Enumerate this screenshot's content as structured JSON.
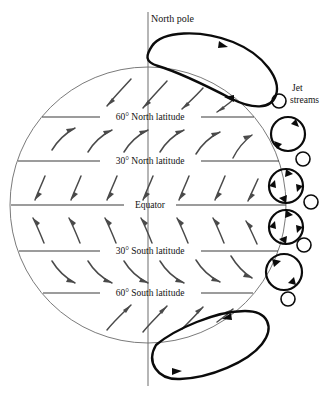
{
  "figure": {
    "type": "diagram"
  },
  "labels": {
    "north_pole": "North pole",
    "jet_streams_line1": "Jet",
    "jet_streams_line2": "streams",
    "latitudes": [
      {
        "id": "lat-60n",
        "text": "60° North latitude"
      },
      {
        "id": "lat-30n",
        "text": "30° North latitude"
      },
      {
        "id": "equator",
        "text": "Equator"
      },
      {
        "id": "lat-30s",
        "text": "30° South latitude"
      },
      {
        "id": "lat-60s",
        "text": "60° South latitude"
      }
    ]
  },
  "colors": {
    "background": "#ffffff",
    "globe_outline": "#6b6b6b",
    "latitude_line": "#3a3a3a",
    "axis_line": "#7a7a7a",
    "wind_arrow": "#4a4a4a",
    "cell_loop": "#0b0b0b",
    "jet_stream": "#0b0b0b",
    "text": "#131313"
  },
  "geometry": {
    "globe_center_x": 148,
    "globe_center_y": 205,
    "globe_radius": 138,
    "axis_top_y": 12,
    "axis_bottom_y": 386,
    "latitude_y": {
      "lat_60n": 117,
      "lat_30n": 161,
      "equator": 205,
      "lat_30s": 251,
      "lat_60s": 293
    }
  },
  "jet_stream_circles": [
    {
      "id": "jet-small-1",
      "cx": 279,
      "cy": 101,
      "r": 7,
      "size": "small"
    },
    {
      "id": "jet-large-1",
      "cx": 288,
      "cy": 134,
      "r": 17,
      "size": "large"
    },
    {
      "id": "jet-small-2",
      "cx": 303,
      "cy": 159,
      "r": 7,
      "size": "small"
    },
    {
      "id": "jet-large-2",
      "cx": 286,
      "cy": 186,
      "r": 17,
      "size": "large"
    },
    {
      "id": "jet-small-3",
      "cx": 311,
      "cy": 202,
      "r": 7,
      "size": "small"
    },
    {
      "id": "jet-large-3",
      "cx": 286,
      "cy": 227,
      "r": 17,
      "size": "large"
    },
    {
      "id": "jet-small-4",
      "cx": 304,
      "cy": 245,
      "r": 7,
      "size": "small"
    },
    {
      "id": "jet-large-4",
      "cx": 284,
      "cy": 272,
      "r": 18,
      "size": "large"
    },
    {
      "id": "jet-small-5",
      "cx": 288,
      "cy": 299,
      "r": 7,
      "size": "small"
    }
  ],
  "circulation_cells": [
    {
      "id": "north-polar-cell",
      "position": "north"
    },
    {
      "id": "south-polar-cell",
      "position": "south"
    }
  ]
}
